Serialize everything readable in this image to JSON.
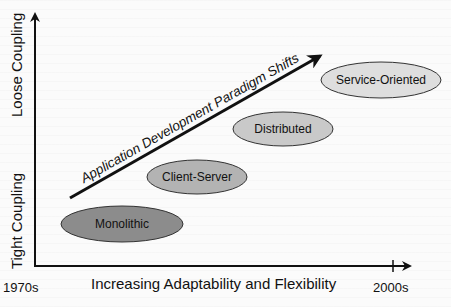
{
  "diagram": {
    "title": "Application Development Paradigm Shifts",
    "y_axis": {
      "top_label": "Loose Coupling",
      "bottom_label": "Tight Coupling"
    },
    "x_axis": {
      "label": "Increasing Adaptability and Flexibility",
      "start_tick": "1970s",
      "end_tick": "2000s"
    },
    "trend_arrow_label": "Application Development Paradigm Shifts",
    "paradigms": [
      {
        "label": "Monolithic",
        "fill": "#8c8c8c"
      },
      {
        "label": "Client-Server",
        "fill": "#b3b3b3"
      },
      {
        "label": "Distributed",
        "fill": "#c9c9c9"
      },
      {
        "label": "Service-Oriented",
        "fill": "#dedede"
      }
    ],
    "colors": {
      "axis": "#111111",
      "ellipse_stroke": "#333333"
    }
  }
}
